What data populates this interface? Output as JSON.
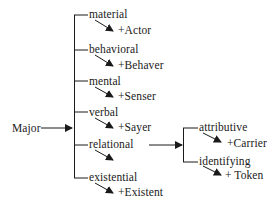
{
  "diagram": {
    "root": {
      "label": "Major"
    },
    "branches": [
      {
        "label": "material",
        "participant": "+Actor"
      },
      {
        "label": "behavioral",
        "participant": "+Behaver"
      },
      {
        "label": "mental",
        "participant": "+Senser"
      },
      {
        "label": "verbal",
        "participant": "+Sayer"
      },
      {
        "label": "relational",
        "participant": null,
        "sub_branches": [
          {
            "label": "attributive",
            "participant": "+Carrier"
          },
          {
            "label": "identifying",
            "participant": "+ Token"
          }
        ]
      },
      {
        "label": "existential",
        "participant": "+Existent"
      }
    ],
    "colors": {
      "line": "#1a1a1a",
      "text": "#1a1a1a",
      "background": "#ffffff"
    }
  }
}
